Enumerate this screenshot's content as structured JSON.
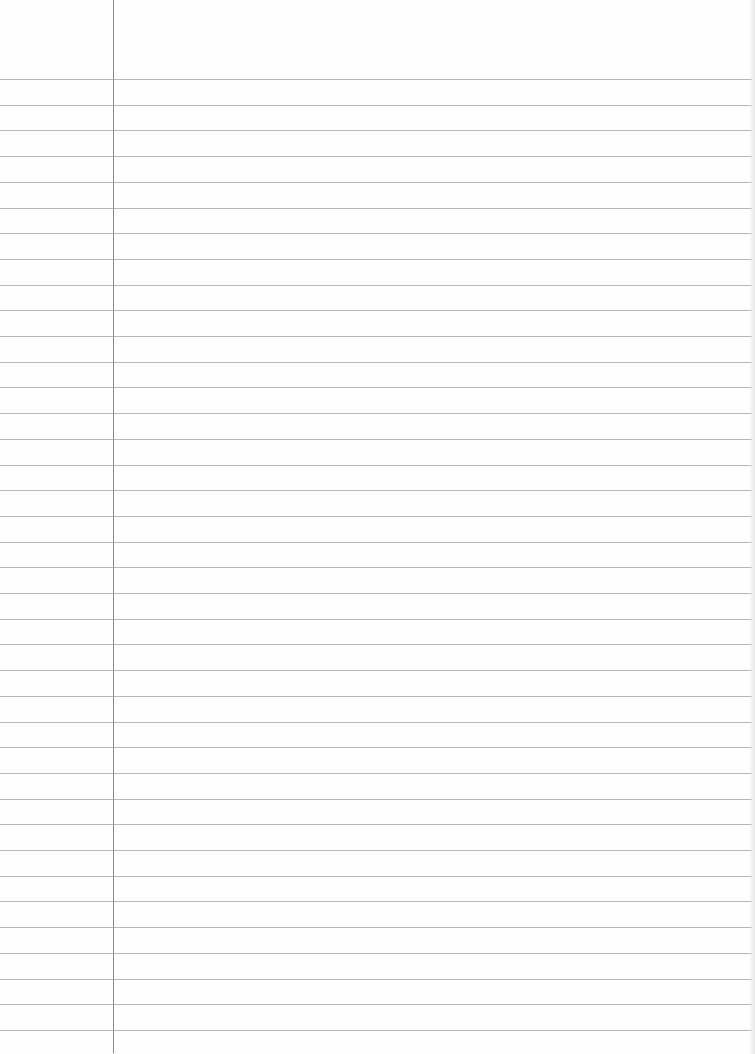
{
  "document": {
    "type": "lined-paper",
    "text": "",
    "colors": {
      "paper": "#fefefe",
      "rule": "#b8b8b8",
      "margin": "#8c8c8c",
      "edge_shadow": "#e6e6e6"
    },
    "layout": {
      "first_rule_y": 79,
      "rule_spacing": 25.7,
      "rule_count": 38,
      "margin_x": 113
    }
  }
}
